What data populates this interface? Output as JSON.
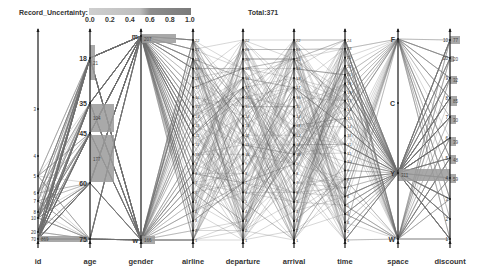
{
  "header": {
    "uncertainty_label": "Record_Uncertainty:",
    "uncertainty_ticks": [
      "0.0",
      "0.2",
      "0.4",
      "0.6",
      "0.8",
      "1.0"
    ],
    "total_label": "Total:371"
  },
  "colors": {
    "axis": "#1a1a1a",
    "line": "#6e6e6e",
    "bar": "#9a9a9a",
    "legend_light": "#c8c8c8",
    "legend_dark": "#7a7a7a"
  },
  "chart_data": {
    "type": "parallel_coordinates",
    "title": "",
    "total_records": 371,
    "legend": {
      "name": "Record_Uncertainty",
      "range": [
        0.0,
        1.0
      ],
      "ticks": [
        0.0,
        0.2,
        0.4,
        0.6,
        0.8,
        1.0
      ]
    },
    "axes": [
      {
        "name": "id",
        "x": 38,
        "ticks": [
          {
            "label": "3",
            "y": 109
          },
          {
            "label": "4",
            "y": 156
          },
          {
            "label": "5",
            "y": 176
          },
          {
            "label": "6",
            "y": 193
          },
          {
            "label": "7",
            "y": 201
          },
          {
            "label": "8",
            "y": 212
          },
          {
            "label": "10",
            "y": 218
          },
          {
            "label": "20",
            "y": 232
          },
          {
            "label": "70",
            "y": 239
          }
        ],
        "bars": [
          {
            "y": 236,
            "h": 6,
            "w": 50,
            "count": "869"
          }
        ]
      },
      {
        "name": "age",
        "x": 90,
        "ticks": [
          {
            "label": "18",
            "y": 58
          },
          {
            "label": "35",
            "y": 103
          },
          {
            "label": "45",
            "y": 133
          },
          {
            "label": "60",
            "y": 183
          },
          {
            "label": "75",
            "y": 239
          }
        ],
        "bars": [
          {
            "y": 45,
            "h": 35,
            "w": 5,
            "count": "21"
          },
          {
            "y": 104,
            "h": 28,
            "w": 24,
            "count": "104"
          },
          {
            "y": 135,
            "h": 47,
            "w": 24,
            "count": "177"
          }
        ]
      },
      {
        "name": "gender",
        "x": 141,
        "ticks": [
          {
            "label": "m",
            "y": 36
          },
          {
            "label": "w",
            "y": 240
          }
        ],
        "bars": [
          {
            "y": 34,
            "h": 9,
            "w": 35,
            "count": "207"
          },
          {
            "y": 236,
            "h": 8,
            "w": 14,
            "count": "166"
          }
        ]
      },
      {
        "name": "airline",
        "x": 193,
        "ticks": []
      },
      {
        "name": "departure",
        "x": 243,
        "ticks": []
      },
      {
        "name": "arrival",
        "x": 294,
        "ticks": []
      },
      {
        "name": "time",
        "x": 345,
        "ticks": []
      },
      {
        "name": "space",
        "x": 398,
        "ticks": [
          {
            "label": "F",
            "y": 39
          },
          {
            "label": "C",
            "y": 103
          },
          {
            "label": "Y",
            "y": 173
          },
          {
            "label": "W",
            "y": 239
          }
        ],
        "bars": [
          {
            "y": 169,
            "h": 12,
            "w": 52,
            "count": "311"
          }
        ]
      },
      {
        "name": "discount",
        "x": 450,
        "ticks": [
          {
            "label": "10",
            "y": 40
          },
          {
            "label": "20",
            "y": 58
          },
          {
            "label": "9",
            "y": 78
          },
          {
            "label": "8",
            "y": 98
          },
          {
            "label": "7",
            "y": 117
          },
          {
            "label": "6",
            "y": 138
          },
          {
            "label": "5",
            "y": 158
          },
          {
            "label": "4",
            "y": 178
          },
          {
            "label": "3",
            "y": 199
          },
          {
            "label": "2",
            "y": 219
          },
          {
            "label": "1",
            "y": 239
          }
        ],
        "bars": [
          {
            "y": 36,
            "h": 8,
            "w": 10,
            "count": "77"
          },
          {
            "y": 56,
            "h": 6,
            "w": 4,
            "count": "20"
          },
          {
            "y": 76,
            "h": 8,
            "w": 7,
            "count": "32"
          },
          {
            "y": 96,
            "h": 10,
            "w": 7,
            "count": "85"
          },
          {
            "y": 115,
            "h": 9,
            "w": 6,
            "count": "30"
          },
          {
            "y": 137,
            "h": 9,
            "w": 6,
            "count": "39"
          },
          {
            "y": 155,
            "h": 9,
            "w": 6,
            "count": "48"
          },
          {
            "y": 174,
            "h": 9,
            "w": 6,
            "count": "59"
          }
        ]
      }
    ],
    "y_range_px": [
      35,
      240
    ]
  }
}
